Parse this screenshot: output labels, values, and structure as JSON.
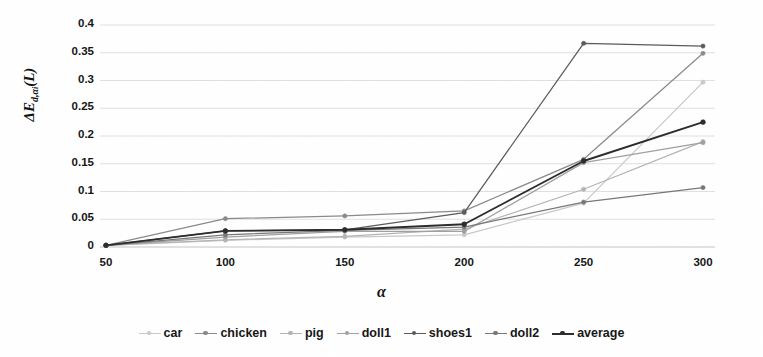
{
  "chart_data": {
    "type": "line",
    "title": "",
    "xlabel": "α",
    "ylabel": "ΔE_{d,α_i}(L)",
    "x": [
      50,
      100,
      150,
      200,
      250,
      300
    ],
    "categories": [
      "50",
      "100",
      "150",
      "200",
      "250",
      "300"
    ],
    "xtick_labels": [
      "50",
      "100",
      "150",
      "200",
      "250",
      "300"
    ],
    "ytick_labels": [
      "0",
      "0.05",
      "0.1",
      "0.15",
      "0.2",
      "0.25",
      "0.3",
      "0.35",
      "0.4"
    ],
    "ytick_values": [
      0,
      0.05,
      0.1,
      0.15,
      0.2,
      0.25,
      0.3,
      0.35,
      0.4
    ],
    "ylim": [
      0,
      0.4
    ],
    "grid": "horizontal",
    "legend_position": "bottom",
    "series": [
      {
        "name": "car",
        "color": "#c9c9c9",
        "values": [
          0.003,
          0.012,
          0.018,
          0.022,
          0.079,
          0.297
        ]
      },
      {
        "name": "chicken",
        "color": "#8a8a8a",
        "values": [
          0.003,
          0.051,
          0.056,
          0.065,
          0.158,
          0.349
        ]
      },
      {
        "name": "pig",
        "color": "#b4b4b4",
        "values": [
          0.003,
          0.013,
          0.019,
          0.032,
          0.104,
          0.19
        ]
      },
      {
        "name": "doll1",
        "color": "#a0a0a0",
        "values": [
          0.003,
          0.018,
          0.028,
          0.028,
          0.152,
          0.188
        ]
      },
      {
        "name": "shoes1",
        "color": "#5a5a5a",
        "values": [
          0.003,
          0.029,
          0.031,
          0.062,
          0.367,
          0.362
        ]
      },
      {
        "name": "doll2",
        "color": "#777777",
        "values": [
          0.003,
          0.022,
          0.03,
          0.036,
          0.081,
          0.107
        ]
      },
      {
        "name": "average",
        "color": "#2b2b2b",
        "values": [
          0.003,
          0.029,
          0.031,
          0.041,
          0.155,
          0.225
        ]
      }
    ]
  },
  "axis": {
    "ylabel_delta": "Δ",
    "ylabel_E": "E",
    "ylabel_sub": "d,α",
    "ylabel_sub2": "i",
    "ylabel_tail": "(L)",
    "xlabel": "α"
  },
  "legend": {
    "items": [
      "car",
      "chicken",
      "pig",
      "doll1",
      "shoes1",
      "doll2",
      "average"
    ]
  }
}
